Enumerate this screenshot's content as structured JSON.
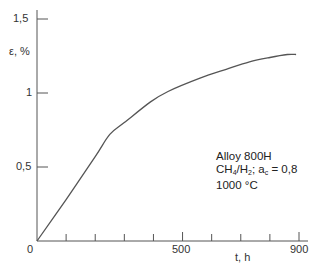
{
  "chart_data": {
    "type": "line",
    "title": "",
    "xlabel": "t, h",
    "ylabel": "ε, %",
    "xlim": [
      0,
      900
    ],
    "ylim": [
      0,
      1.5
    ],
    "x_tick_labels": [
      "0",
      "500",
      "900"
    ],
    "x_minor_ticks": [
      100,
      200,
      300,
      400,
      500,
      600,
      700,
      800,
      900
    ],
    "y_tick_labels": [
      "0",
      "0,5",
      "1",
      "1,5"
    ],
    "y_ticks": [
      0.5,
      1.0,
      1.5
    ],
    "grid": false,
    "legend": null,
    "series": [
      {
        "name": "Alloy 800H",
        "x": [
          0,
          100,
          200,
          250,
          300,
          390,
          450,
          560,
          650,
          730,
          800,
          860,
          890
        ],
        "values": [
          0,
          0.28,
          0.57,
          0.72,
          0.8,
          0.94,
          1.01,
          1.1,
          1.16,
          1.21,
          1.24,
          1.26,
          1.26
        ]
      }
    ],
    "annotations": [
      "Alloy 800H",
      "CH4/H2; ac = 0,8",
      "1000 °C"
    ]
  },
  "axes": {
    "y_label": "ε, %",
    "x_label": "t, h",
    "y_ticks": [
      "0,5",
      "1",
      "1,5"
    ],
    "origin": "0",
    "x_ticks": [
      "500",
      "900"
    ]
  },
  "annotation": {
    "line1": "Alloy 800H",
    "line2_a": "CH",
    "line2_sub1": "4",
    "line2_b": "/H",
    "line2_sub2": "2",
    "line2_c": "; a",
    "line2_sub3": "c",
    "line2_d": " = 0,8",
    "line3": "1000 °C"
  },
  "style": {
    "line_color": "#555555",
    "axis_color": "#555555"
  }
}
